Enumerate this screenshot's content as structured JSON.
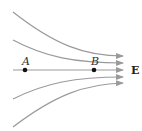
{
  "diagram": {
    "field_label": "E",
    "points": [
      {
        "label": "A",
        "x": 25,
        "y": 70
      },
      {
        "label": "B",
        "x": 94,
        "y": 70
      }
    ],
    "line_color": "#9a9a9a",
    "point_color": "#111111",
    "field_lines": [
      {
        "name": "line-1",
        "path": "M13,12 C55,45 85,56 123,56"
      },
      {
        "name": "line-2",
        "path": "M13,40 C45,57 75,63 123,63"
      },
      {
        "name": "line-3",
        "path": "M13,70 L123,70"
      },
      {
        "name": "line-4",
        "path": "M13,99 C45,83 75,77 123,77"
      },
      {
        "name": "line-5",
        "path": "M13,127 C55,95 85,84 123,83"
      }
    ]
  }
}
